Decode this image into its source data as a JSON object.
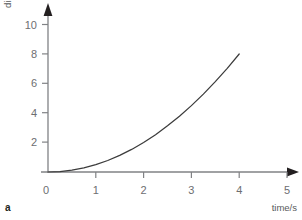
{
  "figure": {
    "panel_label": "a",
    "background": "#ffffff",
    "axis_color": "#808285",
    "curve_color": "#3b3b3b",
    "label_color": "#6d6e71"
  },
  "chart_data": {
    "type": "line",
    "title": "",
    "xlabel": "time/s",
    "ylabel": "distance/m",
    "xlim": [
      0,
      5.6
    ],
    "ylim": [
      0,
      11.2
    ],
    "xticks": [
      0,
      1,
      2,
      3,
      4,
      5
    ],
    "xtick_labels": [
      "0",
      "1",
      "2",
      "3",
      "4",
      "5"
    ],
    "yticks": [
      0,
      2,
      4,
      6,
      8,
      10
    ],
    "ytick_labels": [
      "0",
      "2",
      "4",
      "6",
      "8",
      "10"
    ],
    "grid": false,
    "legend": null,
    "axis_arrows": true,
    "series": [
      {
        "name": "distance",
        "relation": "d = 0.5 * t^2",
        "x": [
          0,
          0.25,
          0.5,
          0.75,
          1,
          1.25,
          1.5,
          1.75,
          2,
          2.25,
          2.5,
          2.75,
          3,
          3.25,
          3.5,
          3.75,
          4
        ],
        "y": [
          0,
          0.03,
          0.13,
          0.28,
          0.5,
          0.78,
          1.13,
          1.53,
          2,
          2.53,
          3.13,
          3.78,
          4.5,
          5.28,
          6.13,
          7.03,
          8
        ]
      }
    ]
  }
}
